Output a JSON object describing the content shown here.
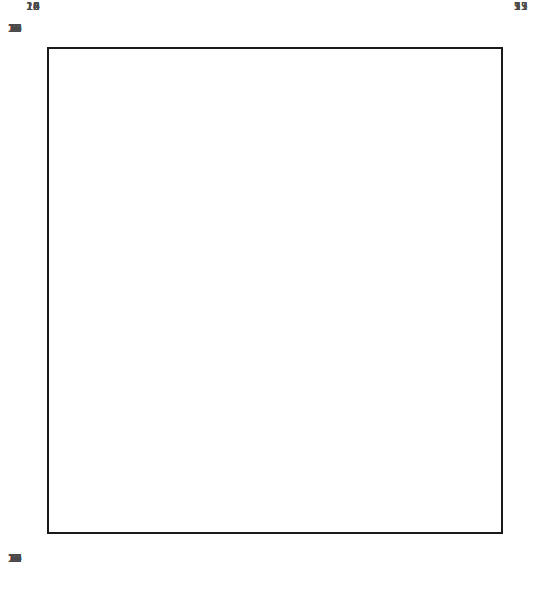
{
  "chart_data": {
    "type": "table",
    "grid": true,
    "column_labels_top": [
      "20",
      "19",
      "18",
      "17",
      "16",
      "15",
      "14",
      "13",
      "12",
      "11",
      "10",
      "9",
      "8",
      "7",
      "6",
      "5",
      "4",
      "3",
      "2",
      "1"
    ],
    "column_labels_bottom": [
      "20",
      "19",
      "18",
      "17",
      "16",
      "15",
      "14",
      "13",
      "12",
      "11",
      "10",
      "9",
      "8",
      "7",
      "6",
      "5",
      "4",
      "3",
      "2",
      "1"
    ],
    "row_labels_left": [
      "20",
      "18",
      "16",
      "14",
      "12",
      "10",
      "8",
      "6",
      "4",
      "2"
    ],
    "row_labels_right": [
      "19",
      "17",
      "15",
      "13",
      "11",
      "9",
      "7",
      "5",
      "3",
      "1"
    ],
    "row_label_left_rows": [
      20,
      18,
      16,
      14,
      12,
      10,
      8,
      6,
      4,
      2
    ],
    "row_label_right_rows": [
      19,
      17,
      15,
      13,
      11,
      9,
      7,
      5,
      3,
      1
    ],
    "symbols": {
      "purl_dot": {
        "glyph": "dot",
        "columns": [
          16,
          14,
          7,
          5
        ],
        "rows": "all"
      },
      "ktbl_v": {
        "glyph": "V",
        "columns": [
          15,
          6
        ],
        "rows": "all"
      },
      "cable_cross": {
        "glyph": "cable",
        "rows": [
          16,
          10,
          4
        ],
        "left_span_columns": [
          13,
          12,
          11
        ],
        "right_span_columns": [
          10,
          9,
          8
        ]
      }
    },
    "cable_rows": [
      16,
      10,
      4
    ],
    "colors": {
      "frame": "#1a1a1a",
      "gridline_minor": "#aeaeae",
      "gridline_major": "#6d6d6d",
      "symbol": "#111111",
      "label": "#4a4a4a",
      "background": "#ffffff"
    },
    "axis_ranges": {
      "x": [
        1,
        20
      ],
      "y": [
        1,
        20
      ]
    },
    "legend": "none"
  }
}
